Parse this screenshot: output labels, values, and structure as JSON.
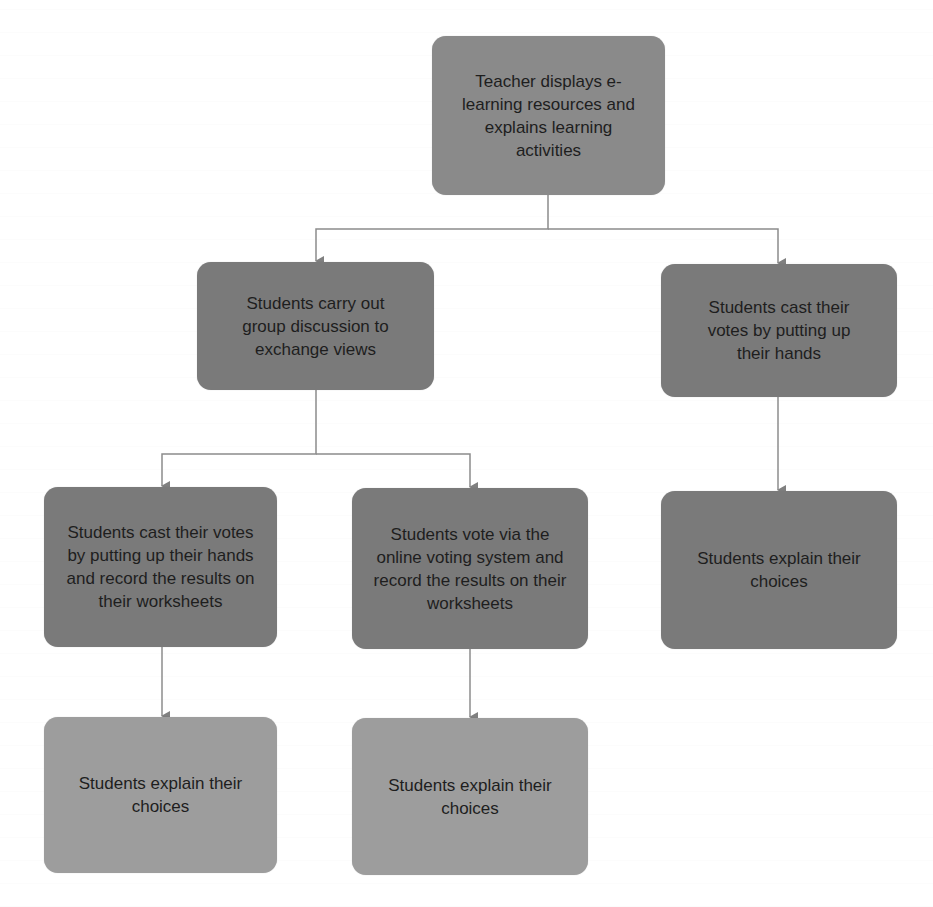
{
  "diagram": {
    "type": "flowchart",
    "colors": {
      "root": "#8a8a8a",
      "level2": "#7a7a7a",
      "level3": "#7a7a7a",
      "leaf": "#9d9d9d",
      "connector": "#8c8c8c",
      "text": "#1e1e1e"
    },
    "nodes": {
      "root": {
        "text": "Teacher displays e-learning resources and explains learning activities"
      },
      "group_discussion": {
        "text": "Students carry out group discussion to exchange views"
      },
      "hands_vote_direct": {
        "text": "Students cast their votes by putting up their hands"
      },
      "hands_vote_record": {
        "text": "Students cast their votes by putting up their hands and record the results on their worksheets"
      },
      "online_vote_record": {
        "text": "Students vote via the online voting system and record the results on their worksheets"
      },
      "explain_right": {
        "text": "Students explain their choices"
      },
      "explain_left": {
        "text": "Students explain their choices"
      },
      "explain_mid": {
        "text": "Students explain their choices"
      }
    },
    "edges": [
      {
        "from": "root",
        "to": "group_discussion"
      },
      {
        "from": "root",
        "to": "hands_vote_direct"
      },
      {
        "from": "group_discussion",
        "to": "hands_vote_record"
      },
      {
        "from": "group_discussion",
        "to": "online_vote_record"
      },
      {
        "from": "hands_vote_record",
        "to": "explain_left"
      },
      {
        "from": "online_vote_record",
        "to": "explain_mid"
      },
      {
        "from": "hands_vote_direct",
        "to": "explain_right"
      }
    ]
  }
}
